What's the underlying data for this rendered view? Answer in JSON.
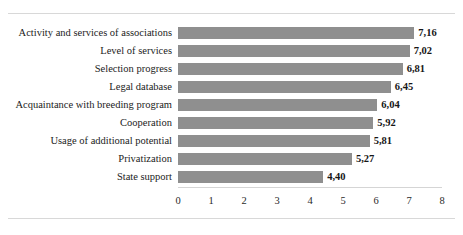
{
  "chart_data": {
    "type": "bar",
    "orientation": "horizontal",
    "title": "",
    "subtitle": "",
    "xlabel": "",
    "ylabel": "",
    "xlim": [
      0,
      8
    ],
    "xticks": [
      "0",
      "1",
      "2",
      "3",
      "4",
      "5",
      "6",
      "7",
      "8"
    ],
    "xtick_values": [
      0,
      1,
      2,
      3,
      4,
      5,
      6,
      7,
      8
    ],
    "grid": false,
    "legend": null,
    "decimal_separator": ",",
    "bar_color": "#8f8f8f",
    "categories": [
      "Activity and services of associations",
      "Level of services",
      "Selection progress",
      "Legal database",
      "Acquaintance with breeding program",
      "Cooperation",
      "Usage of additional potential",
      "Privatization",
      "State support"
    ],
    "values": [
      7.16,
      7.02,
      6.81,
      6.45,
      6.04,
      5.92,
      5.81,
      5.27,
      4.4
    ],
    "value_labels": [
      "7,16",
      "7,02",
      "6,81",
      "6,45",
      "6,04",
      "5,92",
      "5,81",
      "5,27",
      "4,40"
    ]
  }
}
